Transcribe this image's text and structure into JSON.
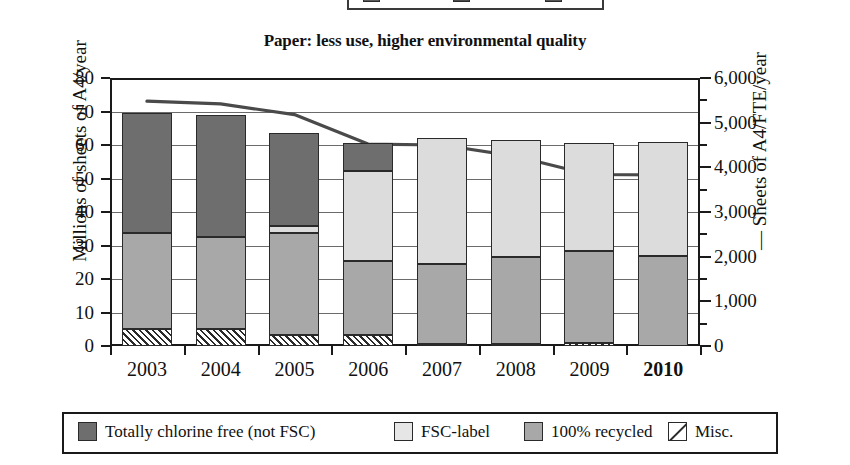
{
  "top_clipped_legend": {
    "note": "partially cropped legend strip from the figure above",
    "swatches": [
      "#5a5a5a",
      "#4a4a4a",
      "#555555"
    ]
  },
  "chart_data": {
    "type": "bar",
    "title": "Paper: less use, higher environmental quality",
    "xlabel": "",
    "ylabel": "Millions of sheets of A4/year",
    "categories": [
      "2003",
      "2004",
      "2005",
      "2006",
      "2007",
      "2008",
      "2009",
      "2010"
    ],
    "highlight_category": "2010",
    "ylim": [
      0,
      80
    ],
    "yticks": [
      "0",
      "10",
      "20",
      "30",
      "40",
      "50",
      "60",
      "70",
      "80"
    ],
    "grid": true,
    "stacked": true,
    "legend_position": "bottom",
    "series": [
      {
        "name": "Misc.",
        "key": "misc",
        "color": "#ffffff",
        "pattern": "diagonal-hatch",
        "values": [
          5.0,
          5.0,
          3.2,
          3.2,
          0.7,
          0.6,
          0.8,
          0.0
        ]
      },
      {
        "name": "100% recycled",
        "key": "rec",
        "color": "#a8a8a8",
        "values": [
          28.8,
          27.5,
          30.5,
          22.3,
          23.8,
          25.9,
          27.7,
          27.0
        ]
      },
      {
        "name": "FSC-label",
        "key": "fsc",
        "color": "#dcdcdc",
        "values": [
          0.0,
          0.0,
          2.0,
          26.8,
          37.5,
          35.0,
          32.2,
          34.0
        ]
      },
      {
        "name": "Totally chlorine free (not FSC)",
        "key": "tcf",
        "color": "#6e6e6e",
        "values": [
          35.7,
          36.5,
          27.8,
          8.2,
          0.0,
          0.0,
          0.0,
          0.0
        ]
      }
    ],
    "totals": [
      69.5,
      69.0,
      63.5,
      60.5,
      62.0,
      61.5,
      60.7,
      61.0
    ],
    "secondary_axis": {
      "label": "Sheets of A4/FTE/year",
      "label_prefix": "—",
      "ylim": [
        0,
        6000
      ],
      "yticks": [
        "0",
        "1,000",
        "2,000",
        "3,000",
        "4,000",
        "5,000",
        "6,000"
      ],
      "line_series": {
        "name": "Sheets of A4/FTE/year",
        "color": "#4a4a4a",
        "values": [
          5480,
          5420,
          5180,
          4520,
          4500,
          4250,
          3840,
          3830
        ]
      }
    }
  },
  "legend": {
    "items": [
      {
        "label": "Totally chlorine free (not FSC)",
        "swatch": "tcf"
      },
      {
        "label": "FSC-label",
        "swatch": "fsc"
      },
      {
        "label": "100% recycled",
        "swatch": "rec"
      },
      {
        "label": "Misc.",
        "swatch": "misc"
      }
    ]
  }
}
